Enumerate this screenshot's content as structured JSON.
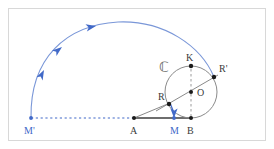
{
  "figure": {
    "frame": {
      "border_color": "#d8d8d8",
      "background": "#ffffff"
    },
    "colors": {
      "blue": "#4169c8",
      "blue_light": "#7a97d8",
      "gray_line": "#8a8a8a",
      "dark_point": "#1a1a1a",
      "label_dark": "#3a3a3a",
      "dashed_gray": "#9a9a9a",
      "baseline_gray": "#6e6e6e"
    },
    "set_label": {
      "text": "ℂ",
      "name": "circle-set-label"
    },
    "points": [
      {
        "id": "Mprime",
        "label": "M'",
        "x": 31,
        "y": 118,
        "label_x": 24,
        "label_y": 134,
        "color": "blue",
        "dot": true
      },
      {
        "id": "A",
        "label": "A",
        "x": 134,
        "y": 118,
        "label_x": 130,
        "label_y": 134,
        "color": "dark",
        "dot": true
      },
      {
        "id": "M",
        "label": "M",
        "x": 174,
        "y": 118,
        "label_x": 170,
        "label_y": 134,
        "color": "blue",
        "dot": true
      },
      {
        "id": "B",
        "label": "B",
        "x": 191,
        "y": 118,
        "label_x": 187,
        "label_y": 134,
        "color": "dark",
        "dot": true
      },
      {
        "id": "O",
        "label": "O",
        "x": 191,
        "y": 92,
        "label_x": 198,
        "label_y": 96,
        "color": "dark",
        "dot": true
      },
      {
        "id": "K",
        "label": "K",
        "x": 191,
        "y": 66,
        "label_x": 186,
        "label_y": 60,
        "color": "dark",
        "dot": true
      },
      {
        "id": "Rprime",
        "label": "R'",
        "x": 214,
        "y": 77,
        "label_x": 219,
        "label_y": 72,
        "color": "dark",
        "dot": true
      },
      {
        "id": "R",
        "label": "R",
        "x": 169,
        "y": 104,
        "label_x": 159,
        "label_y": 100,
        "color": "dark",
        "dot": true
      }
    ],
    "circle": {
      "name": "main-circle",
      "center_x": 191,
      "center_y": 92,
      "radius": 26,
      "stroke": "#8a8a8a"
    },
    "arc": {
      "name": "cycloid-arc",
      "stroke": "#7a97d8",
      "path": "M 31 118 C 31 55, 70 24, 120 22 C 165 20, 200 45, 214 77",
      "arrow_count": 3
    },
    "segments": [
      {
        "name": "baseline-A-B",
        "x1": 134,
        "y1": 118,
        "x2": 191,
        "y2": 118,
        "style": "solid",
        "stroke": "#6e6e6e",
        "width": 1.6
      },
      {
        "name": "dashed-Mprime-A",
        "x1": 31,
        "y1": 118,
        "x2": 134,
        "y2": 118,
        "style": "dashed",
        "stroke": "#4169c8",
        "width": 1.1
      },
      {
        "name": "dashed-K-B",
        "x1": 191,
        "y1": 66,
        "x2": 191,
        "y2": 118,
        "style": "dashed",
        "stroke": "#9a9a9a",
        "width": 1.0
      },
      {
        "name": "chord-R-Rprime",
        "x1": 158,
        "y1": 110,
        "x2": 216,
        "y2": 76,
        "style": "solid",
        "stroke": "#8a8a8a",
        "width": 1.0
      },
      {
        "name": "segment-A-R",
        "x1": 134,
        "y1": 118,
        "x2": 169,
        "y2": 104,
        "style": "solid",
        "stroke": "#8a8a8a",
        "width": 1.0
      }
    ],
    "arrow_R_to_M": {
      "name": "vector-R-to-M",
      "x1": 170,
      "y1": 104,
      "x2": 174,
      "y2": 117,
      "stroke": "#4169c8"
    }
  }
}
